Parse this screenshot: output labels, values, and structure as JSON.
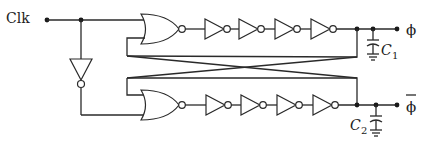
{
  "diagram": {
    "labels": {
      "clk": "Clk",
      "phi": "ϕ",
      "phi_bar": "ϕ",
      "c1_letter": "C",
      "c1_sub": "1",
      "c2_letter": "C",
      "c2_sub": "2"
    },
    "components": {
      "nor_gates": 2,
      "inverters_per_chain": 4,
      "input_inverter": 1,
      "capacitors": [
        "C1",
        "C2"
      ]
    },
    "colors": {
      "line": "#2a2a2a",
      "background": "#ffffff"
    }
  }
}
